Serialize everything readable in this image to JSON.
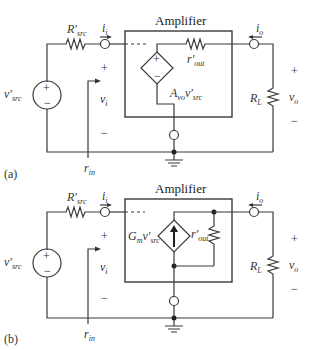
{
  "figure": {
    "panels": [
      {
        "tag": "(a)",
        "title": "Amplifier",
        "source_label": "v",
        "source_sub": "src",
        "rsrc_label": "R",
        "rsrc_sub": "src",
        "ii_label": "i",
        "ii_sub": "i",
        "vi_label": "v",
        "vi_sub": "i",
        "plus": "+",
        "minus": "−",
        "rin_label": "r",
        "rin_sub": "in",
        "dep_label": "A",
        "dep_sub": "vo",
        "dep_v": "v",
        "dep_vsub": "src",
        "rout_label": "r",
        "rout_sub": "out",
        "io_label": "i",
        "io_sub": "o",
        "rl_label": "R",
        "rl_sub": "L",
        "vo_label": "v",
        "vo_sub": "o",
        "dep_type": "voltage-controlled voltage source"
      },
      {
        "tag": "(b)",
        "title": "Amplifier",
        "source_label": "v",
        "source_sub": "src",
        "rsrc_label": "R",
        "rsrc_sub": "src",
        "ii_label": "i",
        "ii_sub": "i",
        "vi_label": "v",
        "vi_sub": "i",
        "plus": "+",
        "minus": "−",
        "rin_label": "r",
        "rin_sub": "in",
        "dep_label": "G",
        "dep_sub": "m",
        "dep_v": "v",
        "dep_vsub": "src",
        "rout_label": "r",
        "rout_sub": "out",
        "io_label": "i",
        "io_sub": "o",
        "rl_label": "R",
        "rl_sub": "L",
        "vo_label": "v",
        "vo_sub": "o",
        "dep_type": "voltage-controlled current source"
      }
    ],
    "prime": "′"
  }
}
